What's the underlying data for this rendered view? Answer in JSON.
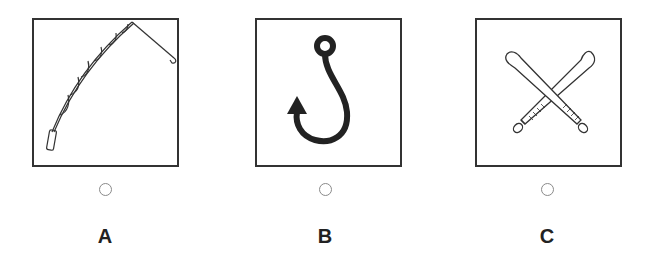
{
  "options": [
    {
      "letter": "A",
      "image": "fishing-rod-icon",
      "description": "Fishing rod with line and hook"
    },
    {
      "letter": "B",
      "image": "fish-hook-icon",
      "description": "Fish hook with barb"
    },
    {
      "letter": "C",
      "image": "crossed-baseball-bats-icon",
      "description": "Two crossed baseball bats"
    }
  ],
  "colors": {
    "border": "#333333",
    "stroke": "#222222",
    "radio": "#8a8a8a"
  }
}
